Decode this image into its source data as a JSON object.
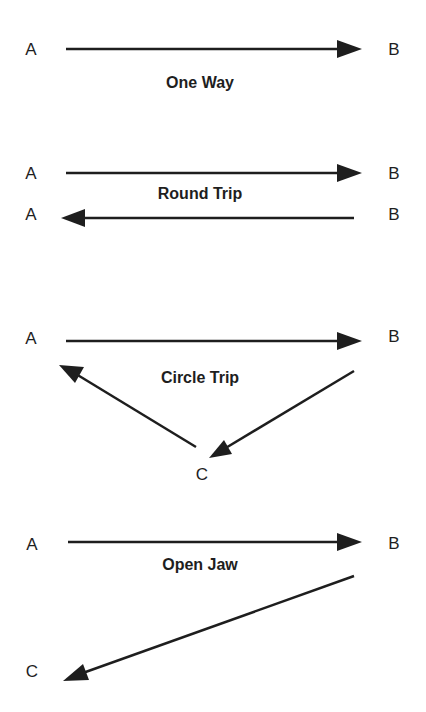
{
  "colors": {
    "background": "#ffffff",
    "ink": "#1e1e1e"
  },
  "diagrams": [
    {
      "title": "One Way",
      "nodes": [
        {
          "id": "A",
          "label": "A"
        },
        {
          "id": "B",
          "label": "B"
        }
      ],
      "edges": [
        {
          "from": "A",
          "to": "B"
        }
      ]
    },
    {
      "title": "Round Trip",
      "nodes": [
        {
          "id": "A1",
          "label": "A"
        },
        {
          "id": "B1",
          "label": "B"
        },
        {
          "id": "A2",
          "label": "A"
        },
        {
          "id": "B2",
          "label": "B"
        }
      ],
      "edges": [
        {
          "from": "A",
          "to": "B"
        },
        {
          "from": "B",
          "to": "A"
        }
      ]
    },
    {
      "title": "Circle Trip",
      "nodes": [
        {
          "id": "A",
          "label": "A"
        },
        {
          "id": "B",
          "label": "B"
        },
        {
          "id": "C",
          "label": "C"
        }
      ],
      "edges": [
        {
          "from": "A",
          "to": "B"
        },
        {
          "from": "B",
          "to": "C"
        },
        {
          "from": "C",
          "to": "A"
        }
      ]
    },
    {
      "title": "Open Jaw",
      "nodes": [
        {
          "id": "A",
          "label": "A"
        },
        {
          "id": "B",
          "label": "B"
        },
        {
          "id": "C",
          "label": "C"
        }
      ],
      "edges": [
        {
          "from": "A",
          "to": "B"
        },
        {
          "from": "B",
          "to": "C"
        }
      ]
    }
  ]
}
